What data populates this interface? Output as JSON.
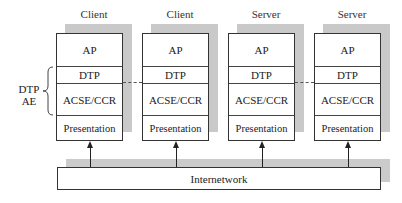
{
  "diagram": {
    "stacks": [
      {
        "title": "Client",
        "layers": [
          "AP",
          "DTP",
          "ACSE/CCR",
          "Presentation"
        ]
      },
      {
        "title": "Client",
        "layers": [
          "AP",
          "DTP",
          "ACSE/CCR",
          "Presentation"
        ]
      },
      {
        "title": "Server",
        "layers": [
          "AP",
          "DTP",
          "ACSE/CCR",
          "Presentation"
        ]
      },
      {
        "title": "Server",
        "layers": [
          "AP",
          "DTP",
          "ACSE/CCR",
          "Presentation"
        ]
      }
    ],
    "bracket_label": {
      "line1": "DTP",
      "line2": "AE"
    },
    "network_label": "Internetwork",
    "connections": [
      {
        "from": "stack-1-dtp",
        "to": "stack-2-dtp",
        "style": "dashed"
      },
      {
        "from": "stack-3-dtp",
        "to": "stack-4-dtp",
        "style": "dashed"
      }
    ],
    "arrows": [
      {
        "from": "internetwork",
        "to": "stack-1-presentation"
      },
      {
        "from": "internetwork",
        "to": "stack-2-presentation"
      },
      {
        "from": "internetwork",
        "to": "stack-3-presentation"
      },
      {
        "from": "internetwork",
        "to": "stack-4-presentation"
      }
    ]
  }
}
